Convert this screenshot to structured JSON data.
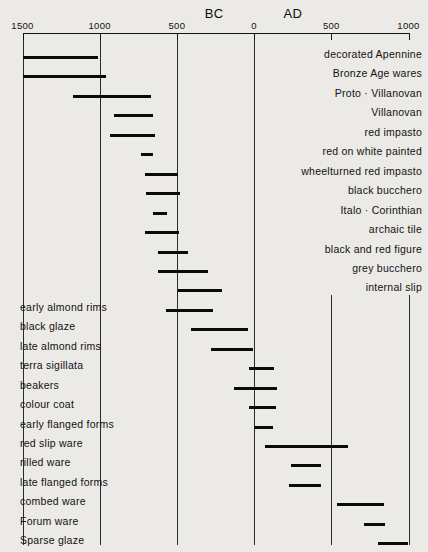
{
  "chart_data": {
    "type": "bar",
    "orientation": "horizontal-range",
    "title": "",
    "xlabel": "",
    "ylabel": "",
    "xlim": [
      -1500,
      1000
    ],
    "grid": true,
    "legend": null,
    "era_labels": [
      {
        "text": "BC",
        "year": -320
      },
      {
        "text": "AD",
        "year": 190
      }
    ],
    "axis": {
      "ticks": [
        {
          "label": "1500",
          "year": -1500
        },
        {
          "label": "1000",
          "year": -1000
        },
        {
          "label": "500",
          "year": -500
        },
        {
          "label": "0",
          "year": 0
        },
        {
          "label": "500",
          "year": 500
        },
        {
          "label": "1000",
          "year": 1000
        }
      ],
      "gridlines": [
        {
          "year": -1500,
          "span": "full"
        },
        {
          "year": -1000,
          "span": "full"
        },
        {
          "year": -500,
          "span": "full"
        },
        {
          "year": 0,
          "span": "full"
        },
        {
          "year": 500,
          "span": "lower"
        },
        {
          "year": 1000,
          "span": "lower"
        }
      ]
    },
    "categories": [
      "decorated Apennine",
      "Bronze Age wares",
      "Proto · Villanovan",
      "Villanovan",
      "red impasto",
      "red on white painted",
      "wheelturned red impasto",
      "black bucchero",
      "Italo · Corinthian",
      "archaic tile",
      "black and red figure",
      "grey bucchero",
      "internal slip",
      "early almond rims",
      "black glaze",
      "late almond rims",
      "terra sigillata",
      "beakers",
      "colour coat",
      "early flanged forms",
      "red slip ware",
      "rilled ware",
      "late flanged forms",
      "combed ware",
      "Forum ware",
      "Sparse glaze"
    ],
    "ranges": [
      {
        "name": "decorated Apennine",
        "start": -1500,
        "end": -1010,
        "label_side": "right"
      },
      {
        "name": "Bronze Age wares",
        "start": -1500,
        "end": -960,
        "label_side": "right"
      },
      {
        "name": "Proto · Villanovan",
        "start": -1175,
        "end": -670,
        "label_side": "right"
      },
      {
        "name": "Villanovan",
        "start": -910,
        "end": -655,
        "label_side": "right"
      },
      {
        "name": "red impasto",
        "start": -935,
        "end": -645,
        "label_side": "right"
      },
      {
        "name": "red on white painted",
        "start": -735,
        "end": -655,
        "label_side": "right"
      },
      {
        "name": "wheelturned red impasto",
        "start": -705,
        "end": -490,
        "label_side": "right"
      },
      {
        "name": "black bucchero",
        "start": -700,
        "end": -480,
        "label_side": "right"
      },
      {
        "name": "Italo · Corinthian",
        "start": -655,
        "end": -565,
        "label_side": "right"
      },
      {
        "name": "archaic tile",
        "start": -705,
        "end": -485,
        "label_side": "right"
      },
      {
        "name": "black and red figure",
        "start": -625,
        "end": -425,
        "label_side": "right"
      },
      {
        "name": "grey bucchero",
        "start": -625,
        "end": -300,
        "label_side": "right"
      },
      {
        "name": "internal slip",
        "start": -490,
        "end": -205,
        "label_side": "right"
      },
      {
        "name": "early almond rims",
        "start": -570,
        "end": -265,
        "label_side": "left"
      },
      {
        "name": "black glaze",
        "start": -410,
        "end": -40,
        "label_side": "left"
      },
      {
        "name": "late almond rims",
        "start": -280,
        "end": -10,
        "label_side": "left"
      },
      {
        "name": "terra sigillata",
        "start": -30,
        "end": 130,
        "label_side": "left"
      },
      {
        "name": "beakers",
        "start": -130,
        "end": 150,
        "label_side": "left"
      },
      {
        "name": "colour coat",
        "start": -30,
        "end": 145,
        "label_side": "left"
      },
      {
        "name": "early flanged forms",
        "start": 0,
        "end": 125,
        "label_side": "left"
      },
      {
        "name": "red slip ware",
        "start": 70,
        "end": 605,
        "label_side": "left"
      },
      {
        "name": "rilled ware",
        "start": 240,
        "end": 435,
        "label_side": "left"
      },
      {
        "name": "late flanged forms",
        "start": 225,
        "end": 435,
        "label_side": "left"
      },
      {
        "name": "combed ware",
        "start": 535,
        "end": 840,
        "label_side": "left"
      },
      {
        "name": "Forum ware",
        "start": 710,
        "end": 850,
        "label_side": "left"
      },
      {
        "name": "Sparse glaze",
        "start": 805,
        "end": 1000,
        "label_side": "left"
      }
    ]
  }
}
